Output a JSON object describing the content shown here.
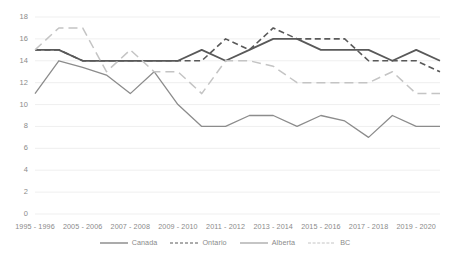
{
  "chart_data": {
    "type": "line",
    "title": "",
    "subtitle": "",
    "xlabel": "",
    "ylabel": "",
    "ylim": [
      0,
      18
    ],
    "ytick_step": 2,
    "yticks": [
      0,
      2,
      4,
      6,
      8,
      10,
      12,
      14,
      16,
      18
    ],
    "grid": true,
    "grid_axis": "y",
    "legend_position": "bottom",
    "categories": [
      "1995 - 1996",
      "",
      "2005 - 2006",
      "",
      "2007 - 2008",
      "",
      "2009 - 2010",
      "",
      "2011 - 2012",
      "",
      "2013 - 2014",
      "",
      "2015 - 2016",
      "",
      "2017 - 2018",
      "",
      "2019 - 2020",
      ""
    ],
    "tick_labels": [
      "1995 - 1996",
      "2005 - 2006",
      "2007 - 2008",
      "2009 - 2010",
      "2011 - 2012",
      "2013 - 2014",
      "2015 - 2016",
      "2017 - 2018",
      "2019 - 2020"
    ],
    "series": [
      {
        "name": "Canada",
        "color": "#595959",
        "style": "solid",
        "width": 1.8,
        "values": [
          15,
          15,
          14,
          14,
          14,
          14,
          14,
          15,
          14,
          15,
          16,
          16,
          15,
          15,
          15,
          14,
          15,
          14
        ]
      },
      {
        "name": "Ontario",
        "color": "#595959",
        "style": "dashed",
        "width": 1.6,
        "values": [
          15,
          15,
          14,
          14,
          14,
          14,
          14,
          14,
          16,
          15,
          17,
          16,
          16,
          16,
          14,
          14,
          14,
          13
        ]
      },
      {
        "name": "Alberta",
        "color": "#8c8c8c",
        "style": "solid",
        "width": 1.3,
        "values": [
          11,
          14,
          13.4,
          12.7,
          11,
          13,
          10,
          8,
          8,
          9,
          9,
          8,
          9,
          8.5,
          7,
          9,
          8,
          8
        ]
      },
      {
        "name": "BC",
        "color": "#c4c4c4",
        "style": "longdash",
        "width": 1.5,
        "values": [
          15,
          17,
          17,
          13,
          15,
          13,
          13,
          11,
          14,
          14,
          13.5,
          12,
          12,
          12,
          12,
          13,
          11,
          11
        ]
      }
    ]
  },
  "legend": {
    "items": [
      {
        "label": "Canada"
      },
      {
        "label": "Ontario"
      },
      {
        "label": "Alberta"
      },
      {
        "label": "BC"
      }
    ]
  },
  "axes": {
    "ytick_labels": [
      "18",
      "16",
      "14",
      "12",
      "10",
      "8",
      "6",
      "4",
      "2",
      "0"
    ]
  }
}
